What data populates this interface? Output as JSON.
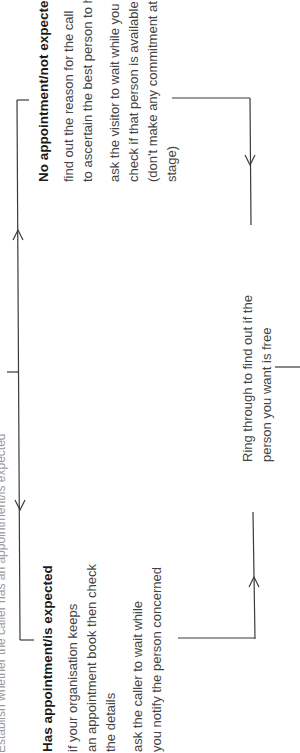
{
  "diagram": {
    "top_cut_text": "Establish whether the caller has an appointment/is expected",
    "no_appointment": {
      "heading": "No appointment/not expected",
      "para1": [
        "find out the reason for the call",
        "to ascertain the best person to help"
      ],
      "para2": [
        "ask the visitor to wait while you",
        "check if that person is available",
        "(don't make any commitment at this",
        "stage)"
      ]
    },
    "has_appointment": {
      "heading": "Has appointment/is expected",
      "para1": [
        "if your organisation keeps",
        "an appointment book then check",
        "the details"
      ],
      "para2": [
        "ask the caller to wait while",
        "you notify the person concerned"
      ]
    },
    "ring_through": {
      "lines": [
        "Ring through to find out if the",
        "person you want is free"
      ]
    },
    "colors": {
      "line": "#3a3a3a",
      "text": "#444444",
      "heading": "#1a1a1a"
    }
  }
}
